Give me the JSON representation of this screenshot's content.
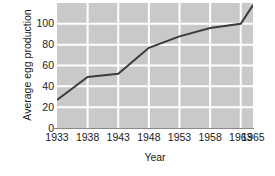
{
  "chart_data": {
    "type": "line",
    "title": "",
    "subtitle": "",
    "xlabel": "Year",
    "ylabel": "Average egg production",
    "x": [
      1933,
      1938,
      1943,
      1948,
      1953,
      1958,
      1963,
      1965
    ],
    "values": [
      27,
      49,
      52,
      77,
      88,
      96,
      100,
      118
    ],
    "series": [
      {
        "name": "Average egg production",
        "values": [
          27,
          49,
          52,
          77,
          88,
          96,
          100,
          118
        ]
      }
    ],
    "xticklabels": [
      "1933",
      "1938",
      "1943",
      "1948",
      "1953",
      "1958",
      "1963",
      "1965"
    ],
    "xtickvalues": [
      1933,
      1938,
      1943,
      1948,
      1953,
      1958,
      1963,
      1965
    ],
    "yticklabels": [
      "0",
      "20",
      "40",
      "60",
      "80",
      "100"
    ],
    "ytickvalues": [
      0,
      20,
      40,
      60,
      80,
      100
    ],
    "xlim": [
      1933,
      1965
    ],
    "ylim": [
      0,
      120
    ],
    "grid": true,
    "grid_color": "#ffffff",
    "plot_background": "#c9c9c9",
    "figure_background": "#ffffff",
    "line_color": "#3c3c3c",
    "line_width": 2,
    "legend": null,
    "legend_position": "none",
    "annotations": []
  }
}
